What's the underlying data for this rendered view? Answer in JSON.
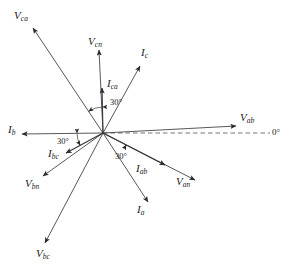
{
  "figure": {
    "background_color": "#ffffff",
    "line_color": "#3a3a3a",
    "text_color": "#1a1a1a",
    "origin": {
      "x": 103,
      "y": 133
    }
  },
  "chart_data": {
    "type": "scatter",
    "title": "",
    "xlabel": "",
    "ylabel": "",
    "grid": false,
    "legend": false,
    "reference_axis": {
      "label": "0°",
      "style": "dashed",
      "angle_deg": 0,
      "from": {
        "x": 103,
        "y": 133
      },
      "to": {
        "x": 270,
        "y": 133
      }
    },
    "origin": {
      "x": 103,
      "y": 133
    },
    "series": [
      {
        "name": "V_ab",
        "label_main": "V",
        "label_sub": "ab",
        "kind": "voltage",
        "angle_deg": 3,
        "length_px": 134,
        "tip": {
          "x": 236,
          "y": 126
        },
        "label_pos": {
          "x": 240,
          "y": 112
        }
      },
      {
        "name": "V_an",
        "label_main": "V",
        "label_sub": "an",
        "kind": "voltage",
        "angle_deg": -27,
        "length_px": 103,
        "tip": {
          "x": 195,
          "y": 180
        },
        "label_pos": {
          "x": 176,
          "y": 176
        }
      },
      {
        "name": "V_cn",
        "label_main": "V",
        "label_sub": "cn",
        "kind": "voltage",
        "angle_deg": 93,
        "length_px": 83,
        "tip": {
          "x": 99,
          "y": 50
        },
        "label_pos": {
          "x": 88,
          "y": 36
        }
      },
      {
        "name": "V_ca",
        "label_main": "V",
        "label_sub": "ca",
        "kind": "voltage",
        "angle_deg": 124,
        "length_px": 126,
        "tip": {
          "x": 33,
          "y": 28
        },
        "label_pos": {
          "x": 14,
          "y": 10
        }
      },
      {
        "name": "V_bn",
        "label_main": "V",
        "label_sub": "bn",
        "kind": "voltage",
        "angle_deg": 215,
        "length_px": 73,
        "tip": {
          "x": 43,
          "y": 176
        },
        "label_pos": {
          "x": 25,
          "y": 178
        }
      },
      {
        "name": "V_bc",
        "label_main": "V",
        "label_sub": "bc",
        "kind": "voltage",
        "angle_deg": 242,
        "length_px": 125,
        "tip": {
          "x": 45,
          "y": 243
        },
        "label_pos": {
          "x": 36,
          "y": 248
        }
      },
      {
        "name": "I_a",
        "label_main": "I",
        "label_sub": "a",
        "kind": "line-current",
        "angle_deg": -57,
        "length_px": 82,
        "tip": {
          "x": 148,
          "y": 202
        },
        "label_pos": {
          "x": 137,
          "y": 204
        }
      },
      {
        "name": "I_b",
        "label_main": "I",
        "label_sub": "b",
        "kind": "line-current",
        "angle_deg": 181,
        "length_px": 81,
        "tip": {
          "x": 22,
          "y": 134
        },
        "label_pos": {
          "x": 8,
          "y": 124
        }
      },
      {
        "name": "I_c",
        "label_main": "I",
        "label_sub": "c",
        "kind": "line-current",
        "angle_deg": 60,
        "length_px": 73,
        "tip": {
          "x": 140,
          "y": 66
        },
        "label_pos": {
          "x": 141,
          "y": 47
        }
      },
      {
        "name": "I_ab",
        "label_main": "I",
        "label_sub": "ab",
        "kind": "phase-current",
        "angle_deg": -27,
        "length_px": 70,
        "tip": {
          "x": 165,
          "y": 165
        },
        "label_pos": {
          "x": 136,
          "y": 163
        }
      },
      {
        "name": "I_bc",
        "label_main": "I",
        "label_sub": "bc",
        "kind": "phase-current",
        "angle_deg": 208,
        "length_px": 42,
        "tip": {
          "x": 66,
          "y": 153
        },
        "label_pos": {
          "x": 48,
          "y": 148
        }
      },
      {
        "name": "I_ca",
        "label_main": "I",
        "label_sub": "ca",
        "kind": "phase-current",
        "angle_deg": 89,
        "length_px": 45,
        "tip": {
          "x": 102,
          "y": 88
        },
        "label_pos": {
          "x": 107,
          "y": 78
        }
      }
    ],
    "angle_annotations": [
      {
        "name": "angle-ca-upper",
        "text": "30°",
        "label_pos": {
          "x": 110,
          "y": 98
        },
        "arc_between": [
          "I_ca",
          "V_ca"
        ],
        "value_deg": 30
      },
      {
        "name": "angle-bc-left",
        "text": "30°",
        "label_pos": {
          "x": 57,
          "y": 137
        },
        "arc_between": [
          "I_b",
          "I_bc"
        ],
        "value_deg": 30
      },
      {
        "name": "angle-ab-lower",
        "text": "30°",
        "label_pos": {
          "x": 115,
          "y": 152
        },
        "arc_between": [
          "I_ab",
          "V_an"
        ],
        "value_deg": 30
      }
    ]
  }
}
